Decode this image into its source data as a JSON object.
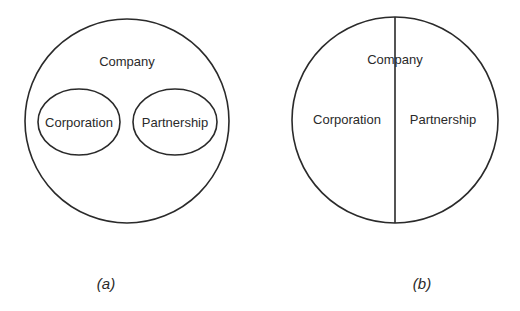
{
  "diagram_a": {
    "outer_label": "Company",
    "inner_left_label": "Corporation",
    "inner_right_label": "Partnership",
    "caption": "(a)"
  },
  "diagram_b": {
    "outer_label": "Company",
    "left_half_label": "Corporation",
    "right_half_label": "Partnership",
    "caption": "(b)"
  },
  "colors": {
    "stroke": "#2a2a2a",
    "background": "#ffffff"
  }
}
